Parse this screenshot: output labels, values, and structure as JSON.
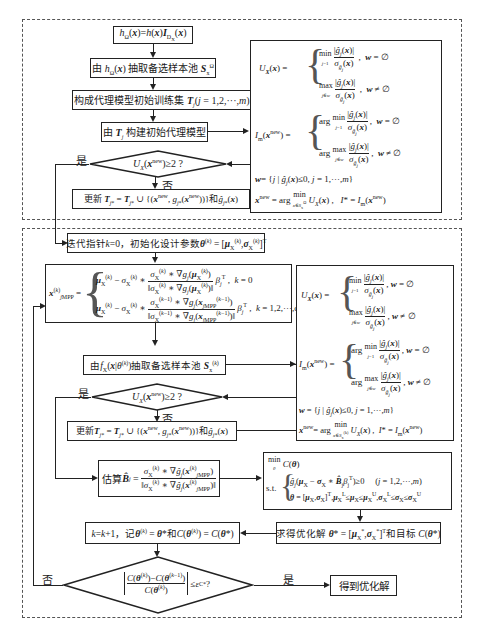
{
  "phase1": {
    "step1": "h_Ω(x)=h(x)I_{D_X}(x)",
    "step2": "由 h_Ω(x) 抽取备选样本池 S_x^Ω",
    "step3": "构成代理模型初始训练集 T_j (j = 1,2,···,m)",
    "step4": "由 T_j 构建初始代理模型",
    "decision": "U_X(x^new)≥2 ?",
    "yes_label": "是",
    "no_label": "否",
    "update": "更新 T_j* = T_j* ∪ {(x^new, g_j*(x^new))} 和 ĝ_j*(x)",
    "formulas": {
      "ux_lhs": "U_X(x) =",
      "ux_case1": "min_{j=1}^{m} |ĝ_j(x)| / σ_{ĝ_j}(x) ,  w = ∅",
      "ux_case2": "max_{j∈w} |ĝ_j(x)| / σ_{ĝ_j}(x) ,  w ≠ ∅",
      "lm_lhs": "I_m(x^new) =",
      "lm_case1": "arg min_{j=1}^{m} |ĝ_j(x)| / σ_{ĝ_j}(x) ,  w = ∅",
      "lm_case2": "arg max_{j∈w} |ĝ_j(x)| / σ_{ĝ_j}(x) ,  w ≠ ∅",
      "w_def": "w = { j | ĝ_j(x) ≤ 0, j = 1,···,m }",
      "xnew_def": "x^new = arg min_{x∈S_x^Ω} U_X(x) ,   I* = I_m(x^new)"
    }
  },
  "phase2": {
    "init": "迭代指针 k=0，初始化设计参数 θ^(k) = [μ_X^(k), σ_X^(k)]^T",
    "xmpp_lhs": "x_jMPP^(k) =",
    "xmpp_case1": "μ_X^(k) − σ_X^(k) ∗ [σ_X^(k) ∗ ∇g_j(μ_X^(k))] / ‖σ_X^(k) ∗ ∇g_j(μ_X^(k))‖ β_j^T ,  k = 0",
    "xmpp_case2": "μ_X^(k) − σ_X^(k) ∗ [σ_X^(k−1) ∗ ∇g_j(x_jMPP^(k−1))] / ‖σ_X^(k−1) ∗ ∇g_j(x_jMPP^(k−1))‖ β_j^T ,  k = 1,2,···,opt",
    "sample": "由 f_X(x|θ^(k)) 抽取备选样本池 S_x^(k)",
    "decision": "U_X(x^new)≥2 ?",
    "yes_label": "是",
    "no_label": "否",
    "update": "更新 T_j* = T_j* ∪ {(x^new, g_j*(x^new))} 和 ĝ_j*(x)",
    "estimate": "估算 B̂_j = σ_X^(k) ∗ ∇ĝ_j(x_jMPP^(k)) / ‖σ_X^(k) ∗ ∇ĝ_j(x_jMPP^(k))‖",
    "formulas": {
      "ux_lhs": "U_X(x) =",
      "ux_case1": "min_{j=1}^{m} |ĝ_j(x)| / σ_{ĝ_j}(x) ,  w = ∅",
      "ux_case2": "max_{j∈w} |ĝ_j(x)| / σ_{ĝ_j}(x) ,  w ≠ ∅",
      "lm_lhs": "I_m(x^new) =",
      "lm_case1": "arg min_{j=1}^{m} |ĝ_j(x)| / σ_{ĝ_j}(x) ,  w = ∅",
      "lm_case2": "arg max_{j∈w} |ĝ_j(x)| / σ_{ĝ_j}(x) ,  w ≠ ∅",
      "w_def": "w = { j | ĝ_j(x) ≤ 0, j = 1,···,m }",
      "xnew_def": "x^new = arg min_{x∈S_x^(k)} U_X(x) ,   I* = I_m(x^new)"
    },
    "optimization": {
      "objective": "min_θ C(θ)",
      "st_label": "s.t.",
      "c1": "ĝ_j(μ_X − σ_X ∗ B̂_j β_j^T) ≥ 0     (j = 1,2,···,m)",
      "c2": "θ = [μ_X, σ_X]^T , μ_X^L ≤ μ_X ≤ μ_X^U , σ_X^L ≤ σ_X ≤ σ_X^U"
    },
    "solve": "求得优化解 θ* = [μ_X*, σ_X*]^T 和目标 C(θ*)",
    "increment": "k=k+1，记 θ^(k) = θ* 和 C(θ^(k)) = C(θ*)",
    "convergence": "|C(θ^(k)) − C(θ^(k−1))| / C(θ^(k)) ≤ ε_C* ?",
    "conv_yes": "是",
    "conv_no": "否",
    "result": "得到优化解"
  }
}
